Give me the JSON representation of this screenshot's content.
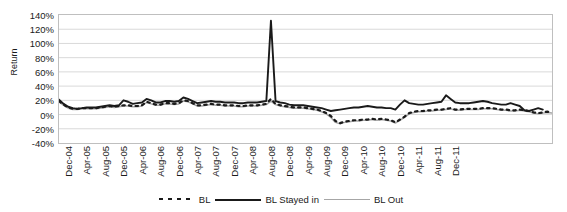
{
  "chart_data": {
    "type": "line",
    "title": "",
    "xlabel": "",
    "ylabel": "Return",
    "ylim": [
      -40,
      140
    ],
    "ytick_labels": [
      "140%",
      "120%",
      "100%",
      "80%",
      "60%",
      "40%",
      "20%",
      "0%",
      "-20%",
      "-40%"
    ],
    "ytick_values": [
      140,
      120,
      100,
      80,
      60,
      40,
      20,
      0,
      -20,
      -40
    ],
    "grid": true,
    "legend_position": "bottom",
    "x_tick_labels": [
      "Dec-04",
      "Apr-05",
      "Aug-05",
      "Dec-05",
      "Apr-06",
      "Aug-06",
      "Dec-06",
      "Apr-07",
      "Aug-07",
      "Dec-07",
      "Apr-08",
      "Aug-08",
      "Dec-08",
      "Apr-09",
      "Aug-09",
      "Dec-09",
      "Apr-10",
      "Aug-10",
      "Dec-10",
      "Apr-11",
      "Aug-11",
      "Dec-11"
    ],
    "x_tick_every_months": 4,
    "x_start": "Dec-04",
    "x_end": "Dec-11",
    "series": [
      {
        "name": "BL",
        "style": "dotted",
        "color": "#1a1a1a",
        "values": [
          19,
          14,
          10,
          8,
          8,
          9,
          9,
          9,
          9,
          10,
          11,
          12,
          11,
          12,
          13,
          13,
          12,
          12,
          13,
          18,
          16,
          14,
          14,
          16,
          16,
          15,
          16,
          20,
          19,
          16,
          13,
          13,
          14,
          15,
          14,
          14,
          13,
          13,
          13,
          12,
          12,
          13,
          13,
          13,
          14,
          15,
          22,
          15,
          13,
          12,
          11,
          10,
          10,
          10,
          9,
          8,
          7,
          5,
          2,
          -2,
          -9,
          -12,
          -10,
          -9,
          -8,
          -8,
          -7,
          -7,
          -6,
          -7,
          -6,
          -7,
          -8,
          -11,
          -7,
          -3,
          2,
          4,
          5,
          5,
          6,
          6,
          7,
          7,
          8,
          9,
          7,
          7,
          8,
          8,
          8,
          8,
          9,
          9,
          9,
          8,
          7,
          7,
          6,
          6,
          7,
          6,
          5,
          3,
          2,
          3,
          4,
          3
        ]
      },
      {
        "name": "BL Stayed in",
        "style": "solid",
        "color": "#1a1a1a",
        "values": [
          21,
          15,
          11,
          9,
          8,
          9,
          10,
          10,
          10,
          11,
          12,
          13,
          12,
          13,
          20,
          18,
          15,
          16,
          17,
          22,
          20,
          17,
          17,
          19,
          19,
          18,
          19,
          24,
          22,
          19,
          16,
          17,
          18,
          19,
          18,
          18,
          17,
          17,
          17,
          16,
          16,
          17,
          17,
          17,
          18,
          19,
          132,
          19,
          17,
          16,
          14,
          13,
          13,
          13,
          12,
          11,
          10,
          9,
          7,
          5,
          6,
          7,
          8,
          9,
          10,
          10,
          11,
          12,
          11,
          10,
          10,
          9,
          9,
          7,
          14,
          20,
          16,
          15,
          14,
          14,
          15,
          16,
          17,
          18,
          27,
          22,
          17,
          16,
          16,
          16,
          17,
          18,
          19,
          18,
          16,
          15,
          14,
          14,
          16,
          14,
          12,
          6,
          5,
          7,
          9,
          7
        ]
      },
      {
        "name": "BL Out",
        "style": "solid",
        "color": "#a6a6a6",
        "values": [
          18,
          13,
          9,
          7,
          7,
          8,
          8,
          8,
          8,
          9,
          10,
          11,
          10,
          11,
          12,
          12,
          11,
          11,
          12,
          17,
          15,
          13,
          13,
          15,
          15,
          14,
          15,
          19,
          18,
          15,
          12,
          12,
          13,
          14,
          13,
          13,
          12,
          12,
          12,
          11,
          11,
          12,
          12,
          12,
          13,
          14,
          19,
          14,
          12,
          11,
          10,
          9,
          9,
          9,
          8,
          7,
          6,
          4,
          1,
          -4,
          -11,
          -13,
          -11,
          -10,
          -9,
          -9,
          -8,
          -8,
          -7,
          -8,
          -7,
          -8,
          -9,
          -12,
          -8,
          -4,
          1,
          3,
          4,
          4,
          5,
          5,
          6,
          6,
          7,
          8,
          6,
          6,
          7,
          7,
          7,
          7,
          8,
          8,
          8,
          7,
          6,
          6,
          5,
          5,
          6,
          5,
          4,
          2,
          1,
          2,
          3,
          2
        ]
      }
    ],
    "annotations": [
      {
        "label": "spike",
        "x": "Oct-07",
        "y": 132
      }
    ]
  },
  "legend": {
    "entries": [
      {
        "label": "BL",
        "swatch": "dotted-line-swatch"
      },
      {
        "label": "BL Stayed in",
        "swatch": "solid-black-line-swatch"
      },
      {
        "label": "BL Out",
        "swatch": "solid-gray-line-swatch"
      }
    ]
  }
}
